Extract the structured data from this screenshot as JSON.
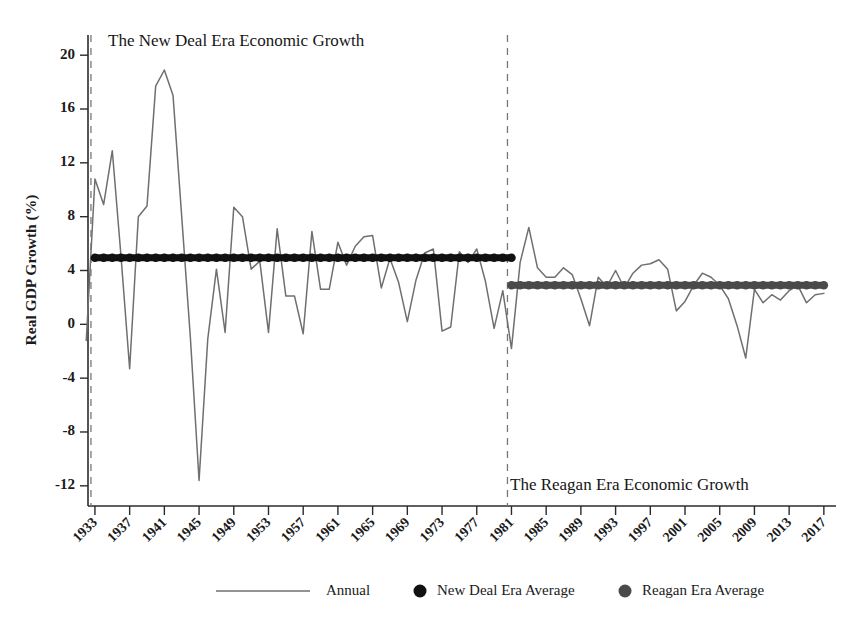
{
  "chart_data": {
    "type": "line",
    "title": "",
    "xlabel": "",
    "ylabel": "Real GDP Growth (%)",
    "ylim": [
      -13.5,
      21.5
    ],
    "xlim": [
      1932,
      2018
    ],
    "yticks": [
      20,
      16,
      12,
      8,
      4,
      0,
      -4,
      -8,
      -12
    ],
    "xticks": [
      1933,
      1937,
      1941,
      1945,
      1949,
      1953,
      1957,
      1961,
      1965,
      1969,
      1973,
      1977,
      1981,
      1985,
      1989,
      1993,
      1997,
      2001,
      2005,
      2009,
      2013,
      2017
    ],
    "grid": false,
    "legend_position": "bottom",
    "annotations": [
      {
        "text": "The New Deal Era Economic Growth",
        "x": 1933,
        "y": 20
      },
      {
        "text": "The Reagan Era Economic Growth",
        "x": 1981,
        "y": -11.2
      }
    ],
    "divider_years": [
      1933,
      1981
    ],
    "series": [
      {
        "name": "Annual",
        "type": "line",
        "color": "#6f6f6f",
        "x": [
          1932,
          1933,
          1934,
          1935,
          1936,
          1937,
          1938,
          1939,
          1940,
          1941,
          1942,
          1943,
          1944,
          1945,
          1946,
          1947,
          1948,
          1949,
          1950,
          1951,
          1952,
          1953,
          1954,
          1955,
          1956,
          1957,
          1958,
          1959,
          1960,
          1961,
          1962,
          1963,
          1964,
          1965,
          1966,
          1967,
          1968,
          1969,
          1970,
          1971,
          1972,
          1973,
          1974,
          1975,
          1976,
          1977,
          1978,
          1979,
          1980,
          1981,
          1982,
          1983,
          1984,
          1985,
          1986,
          1987,
          1988,
          1989,
          1990,
          1991,
          1992,
          1993,
          1994,
          1995,
          1996,
          1997,
          1998,
          1999,
          2000,
          2001,
          2002,
          2003,
          2004,
          2005,
          2006,
          2007,
          2008,
          2009,
          2010,
          2011,
          2012,
          2013,
          2014,
          2015,
          2016,
          2017
        ],
        "values": [
          -1.2,
          10.8,
          8.9,
          12.9,
          5.1,
          -3.3,
          8.0,
          8.8,
          17.7,
          18.9,
          17.0,
          8.0,
          -1.0,
          -11.6,
          -1.1,
          4.1,
          -0.6,
          8.7,
          8.0,
          4.1,
          4.7,
          -0.6,
          7.1,
          2.1,
          2.1,
          -0.7,
          6.9,
          2.6,
          2.6,
          6.1,
          4.4,
          5.8,
          6.5,
          6.6,
          2.7,
          4.9,
          3.1,
          0.2,
          3.3,
          5.3,
          5.6,
          -0.5,
          -0.2,
          5.4,
          4.6,
          5.6,
          3.2,
          -0.3,
          2.5,
          -1.8,
          4.6,
          7.2,
          4.2,
          3.5,
          3.5,
          4.2,
          3.7,
          1.9,
          -0.1,
          3.5,
          2.8,
          4.0,
          2.7,
          3.8,
          4.4,
          4.5,
          4.8,
          4.1,
          1.0,
          1.7,
          2.9,
          3.8,
          3.5,
          2.9,
          1.9,
          -0.1,
          -2.5,
          2.6,
          1.6,
          2.2,
          1.8,
          2.5,
          2.9,
          1.6,
          2.2,
          2.3
        ]
      },
      {
        "name": "New Deal Era Average",
        "type": "marker-line",
        "color": "#111111",
        "value": 4.95,
        "x_start": 1933,
        "x_end": 1981
      },
      {
        "name": "Reagan Era Average",
        "type": "marker-line",
        "color": "#4a4a4a",
        "value": 2.9,
        "x_start": 1981,
        "x_end": 2017
      }
    ]
  },
  "legend": {
    "items": [
      {
        "label": "Annual",
        "marker": "line",
        "color": "#6f6f6f"
      },
      {
        "label": "New Deal Era Average",
        "marker": "circle",
        "color": "#111111"
      },
      {
        "label": "Reagan Era Average",
        "marker": "circle",
        "color": "#4a4a4a"
      }
    ]
  },
  "axis": {
    "ylabel": "Real GDP Growth (%)",
    "ytick_labels": [
      "20",
      "16",
      "12",
      "8",
      "4",
      "0",
      "-4",
      "-8",
      "-12"
    ],
    "xtick_labels": [
      "1933",
      "1937",
      "1941",
      "1945",
      "1949",
      "1953",
      "1957",
      "1961",
      "1965",
      "1969",
      "1973",
      "1977",
      "1981",
      "1985",
      "1989",
      "1993",
      "1997",
      "2001",
      "2005",
      "2009",
      "2013",
      "2017"
    ]
  },
  "annotations": {
    "new_deal": "The New Deal Era Economic Growth",
    "reagan": "The Reagan Era Economic Growth"
  }
}
